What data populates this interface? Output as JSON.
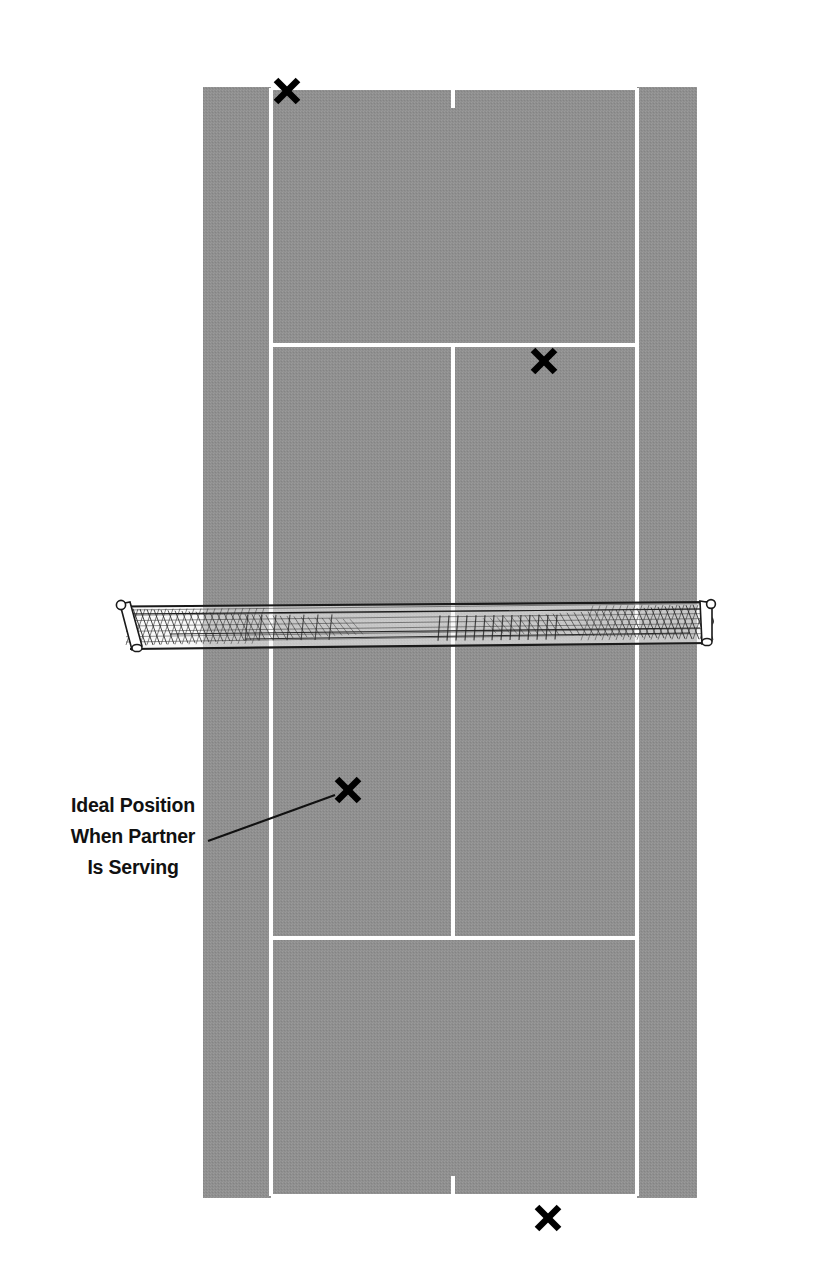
{
  "figure": {
    "background_color": "#ffffff",
    "court_surface_color": "#8f8f8f",
    "court_line_color": "#ffffff",
    "mark_color": "#000000",
    "net_line_color": "#1a1a1a",
    "annotation_color": "#111111"
  },
  "annotation": {
    "name": "ideal-position-callout",
    "lines": [
      "Ideal Position",
      "When Partner",
      "Is Serving"
    ],
    "full_text": "Ideal Position When Partner Is Serving",
    "text_anchor_x": 133,
    "line_y": [
      812,
      843,
      874
    ],
    "leader_line": {
      "from_x": 208,
      "from_y": 841,
      "to_x": 335,
      "to_y": 795
    }
  },
  "court": {
    "surface": {
      "x": 203,
      "y": 87,
      "width": 494,
      "height": 1111
    },
    "lines": [
      {
        "name": "baseline-far",
        "x1": 271,
        "y1": 88,
        "x2": 637,
        "y2": 88,
        "width": 4
      },
      {
        "name": "baseline-near",
        "x1": 271,
        "y1": 1196,
        "x2": 637,
        "y2": 1196,
        "width": 4
      },
      {
        "name": "sideline-singles-left",
        "x1": 271,
        "y1": 88,
        "x2": 271,
        "y2": 1196,
        "width": 4
      },
      {
        "name": "sideline-singles-right",
        "x1": 637,
        "y1": 88,
        "x2": 637,
        "y2": 1196,
        "width": 4
      },
      {
        "name": "service-line-far",
        "x1": 271,
        "y1": 345,
        "x2": 637,
        "y2": 345,
        "width": 4
      },
      {
        "name": "service-line-near",
        "x1": 271,
        "y1": 938,
        "x2": 637,
        "y2": 938,
        "width": 4
      },
      {
        "name": "center-service-line",
        "x1": 453,
        "y1": 345,
        "x2": 453,
        "y2": 938,
        "width": 4
      },
      {
        "name": "center-mark-far",
        "x1": 453,
        "y1": 88,
        "x2": 453,
        "y2": 108,
        "width": 4
      },
      {
        "name": "center-mark-near",
        "x1": 453,
        "y1": 1176,
        "x2": 453,
        "y2": 1196,
        "width": 4
      }
    ]
  },
  "net": {
    "name": "tennis-net",
    "left_post_x": 120,
    "right_post_x": 712,
    "top_y": 604,
    "bottom_y": 648,
    "band_depth": 10
  },
  "position_marks": [
    {
      "name": "mark-far-deuce-receiver",
      "label": "X",
      "cx": 287,
      "cy": 91,
      "size": 28
    },
    {
      "name": "mark-far-net-player",
      "label": "X",
      "cx": 544,
      "cy": 361,
      "size": 28
    },
    {
      "name": "mark-near-net-player",
      "label": "X",
      "cx": 348,
      "cy": 790,
      "size": 28
    },
    {
      "name": "mark-near-server",
      "label": "X",
      "cx": 548,
      "cy": 1218,
      "size": 28
    }
  ]
}
